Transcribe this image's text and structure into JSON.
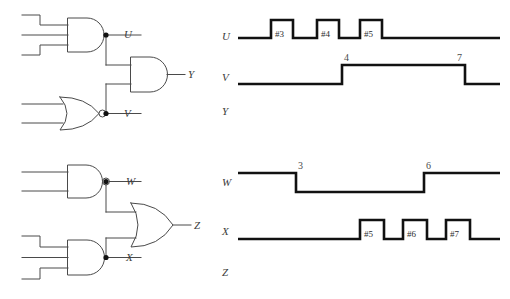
{
  "figure": {
    "background_color": "#ffffff",
    "wire_color": "#4a4a4a",
    "waveform_color": "#111111",
    "label_color": "#3b3b3b"
  },
  "circuits": [
    {
      "id": "circuit-top",
      "gates": [
        {
          "name": "and-gate-u",
          "type": "AND",
          "inputs": 3,
          "inverted_output": false,
          "output_label": "U"
        },
        {
          "name": "nor-gate-v",
          "type": "NOR",
          "inputs": 2,
          "inverted_output": true,
          "output_label": "V"
        },
        {
          "name": "and-gate-y",
          "type": "AND",
          "inputs": 2,
          "inverted_output": false,
          "output_label": "Y"
        }
      ],
      "node_labels": [
        "U",
        "V",
        "Y"
      ]
    },
    {
      "id": "circuit-bottom",
      "gates": [
        {
          "name": "nand-gate-w",
          "type": "NAND",
          "inputs": 2,
          "inverted_output": true,
          "output_label": "W"
        },
        {
          "name": "and-gate-x",
          "type": "AND",
          "inputs": 3,
          "inverted_output": false,
          "output_label": "X"
        },
        {
          "name": "or-gate-z",
          "type": "OR",
          "inputs": 2,
          "inverted_output": false,
          "output_label": "Z"
        }
      ],
      "node_labels": [
        "W",
        "X",
        "Z"
      ]
    }
  ],
  "timing": {
    "rows": [
      {
        "name": "waveform-u",
        "label": "U",
        "initial_level": "low",
        "has_waveform": true,
        "pulses": [
          {
            "tag": "#3",
            "start": 271,
            "end": 293
          },
          {
            "tag": "#4",
            "start": 317,
            "end": 339
          },
          {
            "tag": "#5",
            "start": 360,
            "end": 382
          }
        ],
        "edge_numbers": []
      },
      {
        "name": "waveform-v",
        "label": "V",
        "initial_level": "low",
        "has_waveform": true,
        "pulses": [
          {
            "tag": "",
            "start": 342,
            "end": 465
          }
        ],
        "edge_numbers": [
          {
            "text": "4",
            "x": 342
          },
          {
            "text": "7",
            "x": 465
          }
        ]
      },
      {
        "name": "waveform-y",
        "label": "Y",
        "initial_level": "none",
        "has_waveform": false,
        "pulses": [],
        "edge_numbers": []
      },
      {
        "name": "waveform-w",
        "label": "W",
        "initial_level": "high",
        "has_waveform": true,
        "pulses": [
          {
            "tag": "",
            "start": 296,
            "end": 424
          }
        ],
        "edge_numbers": [
          {
            "text": "3",
            "x": 296
          },
          {
            "text": "6",
            "x": 424
          }
        ]
      },
      {
        "name": "waveform-x",
        "label": "X",
        "initial_level": "low",
        "has_waveform": true,
        "pulses": [
          {
            "tag": "#5",
            "start": 360,
            "end": 384
          },
          {
            "tag": "#6",
            "start": 403,
            "end": 427
          },
          {
            "tag": "#7",
            "start": 446,
            "end": 470
          }
        ],
        "edge_numbers": []
      },
      {
        "name": "waveform-z",
        "label": "Z",
        "initial_level": "none",
        "has_waveform": false,
        "pulses": [],
        "edge_numbers": []
      }
    ]
  }
}
